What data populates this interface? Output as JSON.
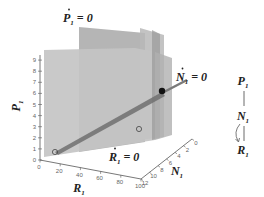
{
  "diagram": {
    "axes": {
      "P": {
        "label_var": "P",
        "label_sub": "1",
        "ticks": [
          "0",
          "1",
          "2",
          "3",
          "4",
          "5",
          "6",
          "7",
          "8",
          "9"
        ]
      },
      "R": {
        "label_var": "R",
        "label_sub": "1",
        "ticks": [
          "0",
          "20",
          "40",
          "60",
          "80",
          "100"
        ]
      },
      "N": {
        "label_var": "N",
        "label_sub": "1",
        "ticks": [
          "12",
          "10",
          "8",
          "6",
          "4",
          "2",
          "0"
        ]
      }
    },
    "nullclines": {
      "P": {
        "var": "P",
        "sub": "1",
        "eq": "= 0"
      },
      "N": {
        "var": "N",
        "sub": "1",
        "eq": "= 0"
      },
      "R": {
        "var": "R",
        "sub": "1",
        "eq": "= 0"
      }
    },
    "food_chain": {
      "top": {
        "var": "P",
        "sub": "1"
      },
      "middle": {
        "var": "N",
        "sub": "1"
      },
      "bottom": {
        "var": "R",
        "sub": "1"
      }
    },
    "points": [
      {
        "kind": "stable-equilibrium",
        "filled": true
      },
      {
        "kind": "unstable-equilibrium-interior",
        "filled": false
      },
      {
        "kind": "unstable-equilibrium-origin",
        "filled": false
      }
    ],
    "colors": {
      "plane_light": "#c8c8c8",
      "plane_mid": "#b4b4b4",
      "plane_dark": "#9e9e9e",
      "line": "#6e6e6e",
      "axis": "#555555",
      "equilibrium_fill": "#111111"
    }
  }
}
